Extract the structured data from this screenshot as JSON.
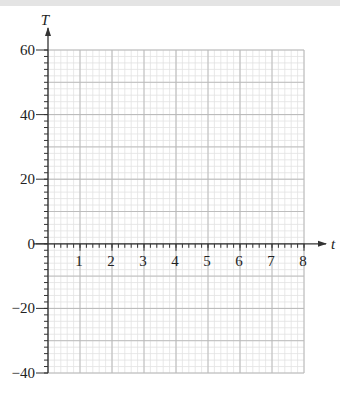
{
  "chart_data": {
    "type": "line",
    "title": "",
    "xlabel": "t",
    "ylabel": "T",
    "xlim": [
      0,
      8
    ],
    "ylim": [
      -40,
      60
    ],
    "x_ticks": [
      1,
      2,
      3,
      4,
      5,
      6,
      7,
      8
    ],
    "y_ticks": [
      60,
      40,
      20,
      0,
      -20,
      -40
    ],
    "x_tick_labels": [
      "1",
      "2",
      "3",
      "4",
      "5",
      "6",
      "7",
      "8"
    ],
    "y_tick_labels": [
      "60",
      "40",
      "20",
      "0",
      "−20",
      "−40"
    ],
    "grid": true,
    "minor_grid": {
      "x_step": 0.2,
      "y_step": 2
    },
    "series": [],
    "legend": null
  },
  "colors": {
    "axis": "#333333",
    "major_grid": "#b8b8b8",
    "minor_grid": "#e2e2e2",
    "top_band": "#e4e4e4"
  }
}
